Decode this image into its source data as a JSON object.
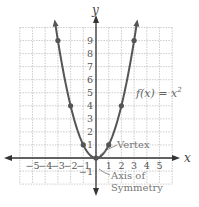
{
  "chart_data": {
    "type": "line",
    "title": "",
    "xlabel": "x",
    "ylabel": "y",
    "xlim": [
      -6,
      6
    ],
    "ylim": [
      -2,
      10
    ],
    "grid": true,
    "x_ticks": [
      "-5",
      "-4",
      "-3",
      "-2",
      "-1",
      "1",
      "2",
      "3",
      "4",
      "5"
    ],
    "y_ticks": [
      "-1",
      "1",
      "2",
      "3",
      "4",
      "5",
      "6",
      "7",
      "8",
      "9"
    ],
    "series": [
      {
        "name": "f(x) = x^2",
        "function": "x^2",
        "points": [
          {
            "x": -3,
            "y": 9
          },
          {
            "x": -2,
            "y": 4
          },
          {
            "x": -1,
            "y": 1
          },
          {
            "x": 0,
            "y": 0
          },
          {
            "x": 1,
            "y": 1
          },
          {
            "x": 2,
            "y": 4
          },
          {
            "x": 3,
            "y": 9
          }
        ],
        "color": "#555555"
      }
    ],
    "annotations": [
      {
        "text": "f(x) = x²",
        "x": 3.4,
        "y": 5
      },
      {
        "text": "Vertex",
        "target": {
          "x": 0,
          "y": 0
        }
      },
      {
        "text": "Axis of Symmetry",
        "target": "x = 0"
      }
    ]
  },
  "labels": {
    "x_axis": "x",
    "y_axis": "y",
    "function_label_prefix": "f(x) = x",
    "function_label_exp": "2",
    "vertex": "Vertex",
    "axis_sym_line1": "Axis of",
    "axis_sym_line2": "Symmetry",
    "x_neg": [
      "−5",
      "−4",
      "−3",
      "−2",
      "−1"
    ],
    "x_pos": [
      "1",
      "2",
      "3",
      "4",
      "5"
    ],
    "y_pos": [
      "1",
      "2",
      "3",
      "4",
      "5",
      "6",
      "7",
      "8",
      "9"
    ],
    "y_neg": [
      "−1"
    ]
  },
  "colors": {
    "curve": "#555555",
    "axis": "#333333",
    "grid": "#aaaaaa"
  }
}
